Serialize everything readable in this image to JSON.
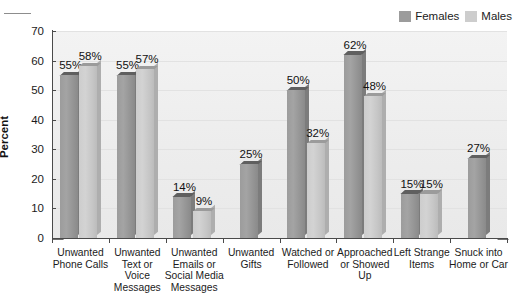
{
  "chart_data": {
    "type": "bar",
    "title": "",
    "xlabel": "",
    "ylabel": "Percent",
    "ylim": [
      0,
      70
    ],
    "yticks": [
      0,
      10,
      20,
      30,
      40,
      50,
      60,
      70
    ],
    "grid": true,
    "legend_position": "top-right",
    "categories": [
      "Unwanted Phone Calls",
      "Unwanted Text or Voice Messages",
      "Unwanted Emails or Social Media Messages",
      "Unwanted Gifts",
      "Watched or Followed",
      "Approached or Showed Up",
      "Left Strange Items",
      "Snuck into Home or Car"
    ],
    "category_lines": [
      [
        "Unwanted",
        "Phone Calls"
      ],
      [
        "Unwanted",
        "Text or",
        "Voice",
        "Messages"
      ],
      [
        "Unwanted",
        "Emails or",
        "Social Media",
        "Messages"
      ],
      [
        "Unwanted",
        "Gifts"
      ],
      [
        "Watched or",
        "Followed"
      ],
      [
        "Approached",
        "or Showed",
        "Up"
      ],
      [
        "Left Strange",
        "Items"
      ],
      [
        "Snuck into",
        "Home or Car"
      ]
    ],
    "series": [
      {
        "name": "Females",
        "color": "#9c9c9c",
        "values": [
          55,
          55,
          14,
          25,
          50,
          62,
          15,
          27
        ],
        "labels": [
          "55%",
          "55%",
          "14%",
          "25%",
          "50%",
          "62%",
          "15%",
          "27%"
        ]
      },
      {
        "name": "Males",
        "color": "#cdcdcd",
        "values": [
          58,
          57,
          9,
          null,
          32,
          48,
          15,
          null
        ],
        "labels": [
          "58%",
          "57%",
          "9%",
          null,
          "32%",
          "48%",
          "15%",
          null
        ]
      }
    ]
  },
  "legend": {
    "items": [
      {
        "label": "Females",
        "swatch": "females-swatch"
      },
      {
        "label": "Males",
        "swatch": "males-swatch"
      }
    ]
  },
  "axis": {
    "y_title": "Percent",
    "y_tick_labels": [
      "70",
      "60",
      "50",
      "40",
      "30",
      "20",
      "10",
      "0"
    ]
  }
}
